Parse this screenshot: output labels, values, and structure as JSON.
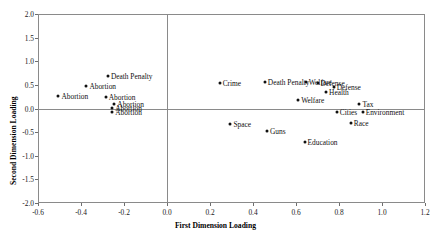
{
  "chart_data": {
    "type": "scatter",
    "title": "",
    "xlabel": "First Dimension Loading",
    "ylabel": "Second Dimension Loading",
    "xlim": [
      -0.6,
      1.2
    ],
    "ylim": [
      -2.0,
      2.0
    ],
    "xticks": [
      "-0.6",
      "-0.4",
      "-0.2",
      "0.0",
      "0.2",
      "0.4",
      "0.6",
      "0.8",
      "1.0",
      "1.2"
    ],
    "xtick_values": [
      -0.6,
      -0.4,
      -0.2,
      0.0,
      0.2,
      0.4,
      0.6,
      0.8,
      1.0,
      1.2
    ],
    "yticks": [
      "-2.0",
      "-1.5",
      "-1.0",
      "-0.5",
      "0.0",
      "0.5",
      "1.0",
      "1.5",
      "2.0"
    ],
    "ytick_values": [
      -2.0,
      -1.5,
      -1.0,
      -0.5,
      0.0,
      0.5,
      1.0,
      1.5,
      2.0
    ],
    "grid": false,
    "legend": "none",
    "reference_lines": [
      {
        "axis": "x",
        "value": 0.0
      },
      {
        "axis": "y",
        "value": 0.0
      }
    ],
    "marker_color": "#111111",
    "frame_color": "#8a8a8a",
    "points": [
      {
        "label": "Death Penalty",
        "x": -0.275,
        "y": 0.69,
        "label_side": "right"
      },
      {
        "label": "Abortion",
        "x": -0.375,
        "y": 0.47,
        "label_side": "right"
      },
      {
        "label": "Abortion",
        "x": -0.505,
        "y": 0.27,
        "label_side": "right"
      },
      {
        "label": "Abortion",
        "x": -0.285,
        "y": 0.24,
        "label_side": "right"
      },
      {
        "label": "Abortion",
        "x": -0.245,
        "y": 0.1,
        "label_side": "right"
      },
      {
        "label": "Abortion",
        "x": -0.255,
        "y": 0.02,
        "label_side": "right"
      },
      {
        "label": "Abortion",
        "x": -0.255,
        "y": -0.07,
        "label_side": "right"
      },
      {
        "label": "Crime",
        "x": 0.245,
        "y": 0.545,
        "label_side": "right"
      },
      {
        "label": "Death Penalty",
        "x": 0.455,
        "y": 0.565,
        "label_side": "right"
      },
      {
        "label": "Welfare",
        "x": 0.645,
        "y": 0.565,
        "label_side": "right"
      },
      {
        "label": "Defense",
        "x": 0.7,
        "y": 0.545,
        "label_side": "right"
      },
      {
        "label": "Defense",
        "x": 0.775,
        "y": 0.455,
        "label_side": "right"
      },
      {
        "label": "Health",
        "x": 0.74,
        "y": 0.355,
        "label_side": "right"
      },
      {
        "label": "Welfare",
        "x": 0.61,
        "y": 0.175,
        "label_side": "right"
      },
      {
        "label": "Tax",
        "x": 0.895,
        "y": 0.085,
        "label_side": "right"
      },
      {
        "label": "Cities",
        "x": 0.79,
        "y": -0.075,
        "label_side": "right"
      },
      {
        "label": "Environment",
        "x": 0.91,
        "y": -0.075,
        "label_side": "right"
      },
      {
        "label": "Space",
        "x": 0.295,
        "y": -0.325,
        "label_side": "right"
      },
      {
        "label": "Race",
        "x": 0.855,
        "y": -0.315,
        "label_side": "right"
      },
      {
        "label": "Guns",
        "x": 0.465,
        "y": -0.485,
        "label_side": "right"
      },
      {
        "label": "Education",
        "x": 0.64,
        "y": -0.705,
        "label_side": "right"
      }
    ]
  }
}
